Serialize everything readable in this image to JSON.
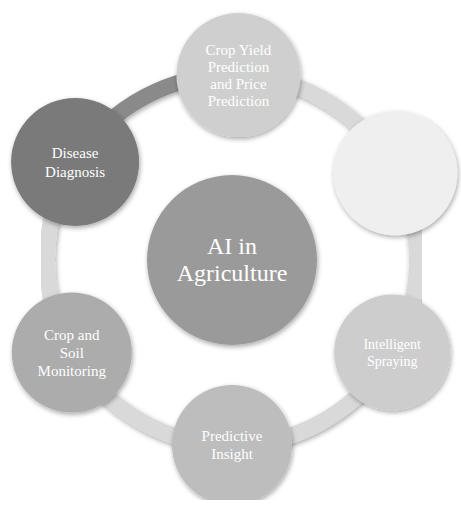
{
  "diagram": {
    "type": "hub-and-ring",
    "center": {
      "label_lines": [
        "AI in",
        "Agriculture"
      ],
      "color": "#9a9a9a"
    },
    "ring_color": "#d9d9d9",
    "nodes": [
      {
        "id": "crop-yield",
        "label_lines": [
          "Crop Yield",
          "Prediction",
          "and Price",
          "Prediction"
        ],
        "color": "#cfcfcf"
      },
      {
        "id": "top-right",
        "label_lines": [],
        "label_legible": false,
        "color": "#efefef"
      },
      {
        "id": "intelligent-spraying",
        "label_lines": [
          "Intelligent",
          "Spraying"
        ],
        "color": "#cdcdcd"
      },
      {
        "id": "predictive-insight",
        "label_lines": [
          "Predictive",
          "Insight"
        ],
        "color": "#bdbdbd"
      },
      {
        "id": "crop-soil-monitoring",
        "label_lines": [
          "Crop and",
          "Soil",
          "Monitoring"
        ],
        "color": "#acacac"
      },
      {
        "id": "disease-diagnosis",
        "label_lines": [
          "Disease",
          "Diagnosis"
        ],
        "color": "#7a7a7a"
      }
    ]
  },
  "caption": {
    "label": "",
    "text": "",
    "legible": false
  }
}
